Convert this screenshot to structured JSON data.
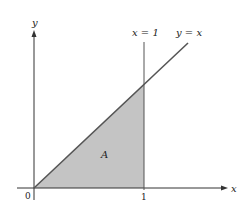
{
  "diagram": {
    "axes": {
      "x_label": "x",
      "y_label": "y"
    },
    "curves": [
      {
        "name": "line-y-equals-x",
        "label": "y = x"
      },
      {
        "name": "line-x-equals-1",
        "label": "x = 1"
      }
    ],
    "region": {
      "label": "A",
      "fill": "#c4c4c4"
    },
    "ticks": {
      "origin": "0",
      "x_one": "1"
    },
    "colors": {
      "line": "#555555",
      "axis": "#333333",
      "text": "#222222"
    }
  }
}
